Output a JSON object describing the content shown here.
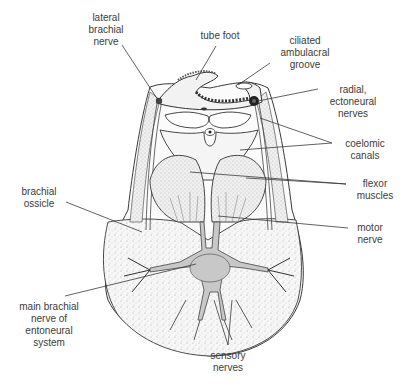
{
  "diagram": {
    "labels": {
      "lateral_brachial_nerve": [
        "lateral",
        "brachial",
        "nerve"
      ],
      "tube_foot": [
        "tube foot"
      ],
      "ciliated_ambulacral_groove": [
        "ciliated",
        "ambulacral",
        "groove"
      ],
      "radial_ectoneural_nerves": [
        "radial,",
        "ectoneural",
        "nerves"
      ],
      "coelomic_canals": [
        "coelomic",
        "canals"
      ],
      "flexor_muscles": [
        "flexor",
        "muscles"
      ],
      "brachial_ossicle": [
        "brachial",
        "ossicle"
      ],
      "motor_nerve": [
        "motor",
        "nerve"
      ],
      "main_brachial_nerve": [
        "main brachial",
        "nerve of",
        "entoneural",
        "system"
      ],
      "sensory_nerves": [
        "sensory",
        "nerves"
      ]
    },
    "colors": {
      "line": "#3a3a3a",
      "stipple_fill": "#efefef",
      "nerve_fill": "#c8c8c8",
      "text": "#3c3c3c"
    }
  }
}
